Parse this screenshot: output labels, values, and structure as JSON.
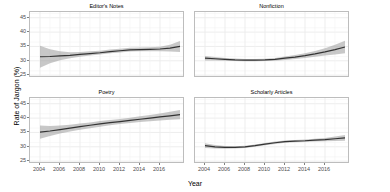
{
  "chart_data": {
    "type": "line",
    "title": "",
    "xlabel": "Year",
    "ylabel": "Rate of Jargon (%)",
    "xlim": [
      2003,
      2018.5
    ],
    "ylim": [
      24,
      47
    ],
    "grid": true,
    "legend_position": "none",
    "facet_layout": "2x2",
    "xticks": [
      2004,
      2006,
      2008,
      2010,
      2012,
      2014,
      2016
    ],
    "yticks": [
      25,
      30,
      35,
      40,
      45
    ],
    "line_color": "#333333",
    "ribbon_color": "#9a9a9a",
    "panel_background": "#ffffff",
    "grid_color": "#ebebeb",
    "panels": [
      {
        "title": "Editor's Notes",
        "x": [
          2004,
          2005,
          2006,
          2007,
          2008,
          2009,
          2010,
          2011,
          2012,
          2013,
          2014,
          2015,
          2016,
          2017,
          2018
        ],
        "values": [
          31.4,
          31.5,
          31.7,
          31.9,
          32.2,
          32.5,
          32.8,
          33.2,
          33.5,
          33.8,
          33.9,
          34.0,
          34.1,
          34.4,
          35.0
        ],
        "ci_lower": [
          27.6,
          29.1,
          30.2,
          30.9,
          31.4,
          31.8,
          32.2,
          32.6,
          32.9,
          33.2,
          33.3,
          33.3,
          33.3,
          33.2,
          33.1
        ],
        "ci_upper": [
          35.2,
          34.0,
          33.3,
          33.0,
          33.1,
          33.3,
          33.5,
          33.9,
          34.2,
          34.5,
          34.6,
          34.7,
          34.9,
          35.6,
          36.9
        ]
      },
      {
        "title": "Nonfiction",
        "x": [
          2004,
          2005,
          2006,
          2007,
          2008,
          2009,
          2010,
          2011,
          2012,
          2013,
          2014,
          2015,
          2016,
          2017,
          2018
        ],
        "values": [
          30.9,
          30.7,
          30.5,
          30.3,
          30.2,
          30.2,
          30.3,
          30.5,
          30.9,
          31.3,
          31.8,
          32.4,
          33.1,
          33.9,
          34.8
        ],
        "ci_lower": [
          30.1,
          30.1,
          30.0,
          29.9,
          29.8,
          29.8,
          29.9,
          30.0,
          30.3,
          30.6,
          31.0,
          31.4,
          31.8,
          32.2,
          32.6
        ],
        "ci_upper": [
          31.7,
          31.3,
          31.0,
          30.8,
          30.6,
          30.6,
          30.7,
          31.0,
          31.5,
          32.0,
          32.6,
          33.4,
          34.4,
          35.6,
          37.0
        ]
      },
      {
        "title": "Poetry",
        "x": [
          2004,
          2005,
          2006,
          2007,
          2008,
          2009,
          2010,
          2011,
          2012,
          2013,
          2014,
          2015,
          2016,
          2017,
          2018
        ],
        "values": [
          35.1,
          35.5,
          36.0,
          36.5,
          37.0,
          37.5,
          38.0,
          38.4,
          38.8,
          39.2,
          39.6,
          40.0,
          40.4,
          40.8,
          41.2
        ],
        "ci_lower": [
          32.8,
          33.8,
          34.6,
          35.3,
          35.9,
          36.5,
          37.0,
          37.5,
          37.9,
          38.3,
          38.6,
          38.9,
          39.2,
          39.4,
          39.6
        ],
        "ci_upper": [
          37.4,
          37.2,
          37.4,
          37.7,
          38.1,
          38.5,
          39.0,
          39.3,
          39.7,
          40.1,
          40.6,
          41.1,
          41.6,
          42.2,
          42.8
        ]
      },
      {
        "title": "Scholarly Articles",
        "x": [
          2004,
          2005,
          2006,
          2007,
          2008,
          2009,
          2010,
          2011,
          2012,
          2013,
          2014,
          2015,
          2016,
          2017,
          2018
        ],
        "values": [
          30.4,
          30.0,
          29.8,
          29.8,
          30.0,
          30.4,
          30.9,
          31.4,
          31.8,
          32.0,
          32.1,
          32.3,
          32.5,
          32.8,
          33.1
        ],
        "ci_lower": [
          29.6,
          29.4,
          29.3,
          29.4,
          29.6,
          30.0,
          30.5,
          31.0,
          31.4,
          31.6,
          31.7,
          31.8,
          31.9,
          32.0,
          32.1
        ],
        "ci_upper": [
          31.2,
          30.6,
          30.3,
          30.2,
          30.4,
          30.8,
          31.3,
          31.8,
          32.2,
          32.4,
          32.5,
          32.8,
          33.1,
          33.6,
          34.1
        ]
      }
    ]
  }
}
